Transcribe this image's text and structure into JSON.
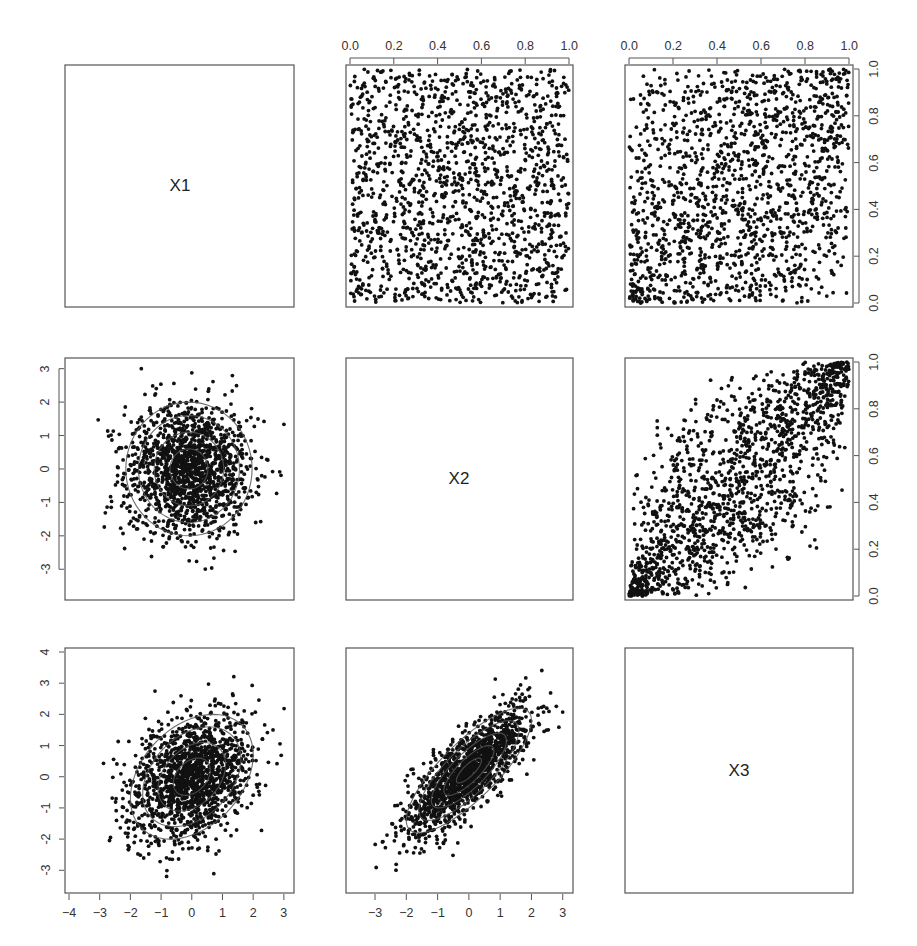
{
  "chart_data": {
    "type": "scatter",
    "title": "",
    "layout": "pairs-plot 3x3",
    "variables": [
      "X1",
      "X2",
      "X3"
    ],
    "grid": false,
    "n_points_approx": 1500,
    "upper_panels": {
      "description": "Copula (uniform margins) scatter plots",
      "axis_range": [
        0,
        1
      ],
      "ticks": [
        "0.0",
        "0.2",
        "0.4",
        "0.6",
        "0.8",
        "1.0"
      ],
      "panels": [
        {
          "row": 1,
          "col": 2,
          "pair": "X1-X2",
          "pattern": "independent uniform",
          "rank_corr": 0.0
        },
        {
          "row": 1,
          "col": 3,
          "pair": "X1-X3",
          "pattern": "weak positive dependence, lower/upper tail clustering",
          "rank_corr": 0.35
        },
        {
          "row": 2,
          "col": 3,
          "pair": "X2-X3",
          "pattern": "strong positive dependence, tail clustering",
          "rank_corr": 0.8
        }
      ]
    },
    "lower_panels": {
      "description": "Standard normal margins scatter with density contour ellipses",
      "panels": [
        {
          "row": 2,
          "col": 1,
          "pair": "X2-X1",
          "corr": 0.0,
          "yticks": [
            "-3",
            "-2",
            "-1",
            "0",
            "1",
            "2",
            "3"
          ],
          "ylim": [
            -3.8,
            3.2
          ],
          "xlim": [
            -3.8,
            3.2
          ],
          "contour_label": "0.02"
        },
        {
          "row": 3,
          "col": 1,
          "pair": "X3-X1",
          "corr": 0.35,
          "xticks": [
            "-4",
            "-3",
            "-2",
            "-1",
            "0",
            "1",
            "2",
            "3"
          ],
          "yticks": [
            "-3",
            "-2",
            "-1",
            "0",
            "1",
            "2",
            "3",
            "4"
          ],
          "xlim": [
            -4,
            3.2
          ],
          "ylim": [
            -3.6,
            4
          ],
          "contour_label": "0.02"
        },
        {
          "row": 3,
          "col": 2,
          "pair": "X3-X2",
          "corr": 0.8,
          "xticks": [
            "-3",
            "-2",
            "-1",
            "0",
            "1",
            "2",
            "3"
          ],
          "xlim": [
            -3.8,
            3.2
          ],
          "ylim": [
            -3.8,
            3.8
          ],
          "contour_label": "0.02"
        }
      ]
    },
    "diagonal_labels": [
      "X1",
      "X2",
      "X3"
    ]
  },
  "labels": {
    "x1": "X1",
    "x2": "X2",
    "x3": "X3"
  },
  "axes": {
    "unit_ticks": [
      "0.0",
      "0.2",
      "0.4",
      "0.6",
      "0.8",
      "1.0"
    ],
    "normal_ticks_y_r2": [
      "-3",
      "-2",
      "-1",
      "0",
      "1",
      "2",
      "3"
    ],
    "normal_ticks_y_r3": [
      "-3",
      "-2",
      "-1",
      "0",
      "1",
      "2",
      "3",
      "4"
    ],
    "normal_ticks_x_c1": [
      "-4",
      "-3",
      "-2",
      "-1",
      "0",
      "1",
      "2",
      "3"
    ],
    "normal_ticks_x_c2": [
      "-3",
      "-2",
      "-1",
      "0",
      "1",
      "2",
      "3"
    ]
  },
  "colors": {
    "point": "#111111",
    "frame": "#555555",
    "contour": "#555555",
    "background": "#ffffff"
  }
}
